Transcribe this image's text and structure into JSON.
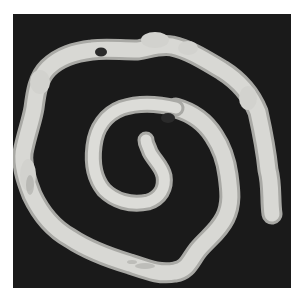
{
  "image": {
    "subject": "spiral-shaped worm specimen",
    "background_color": "#1a1a1a",
    "page_color": "#ffffff",
    "specimen_color": "#d8d8d4",
    "specimen_shadow": "#a9a9a5",
    "spot_color": "#2a2a2a"
  }
}
